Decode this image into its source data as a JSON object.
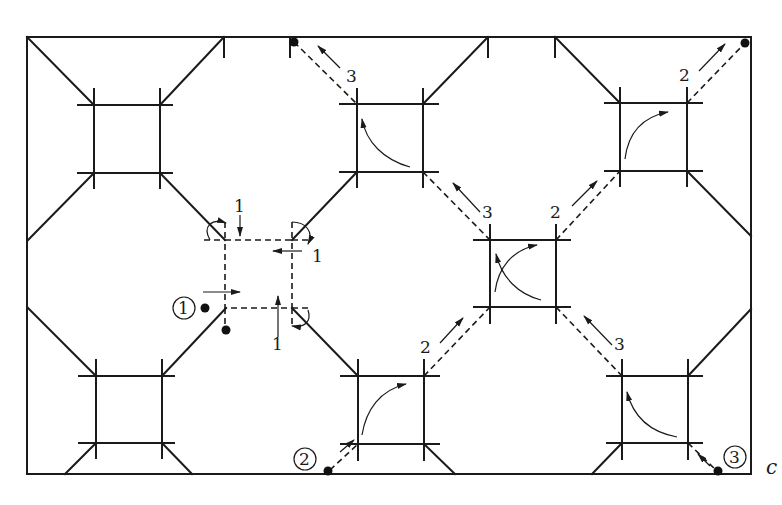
{
  "figure": {
    "type": "geometric-pattern-diagram",
    "corner_label": "c",
    "colors": {
      "line": "#1a1a1a",
      "background": "#ffffff"
    }
  },
  "start_markers": [
    {
      "id": "1",
      "label": "1"
    },
    {
      "id": "2",
      "label": "2"
    },
    {
      "id": "3",
      "label": "3"
    }
  ],
  "path_labels": {
    "path1": [
      "1",
      "1",
      "1"
    ],
    "path2": [
      "2",
      "2",
      "2",
      "2"
    ],
    "path3": [
      "3",
      "3",
      "3",
      "3"
    ]
  },
  "labels": {
    "p1_top": "1",
    "p1_right": "1",
    "p1_bottom": "1",
    "p3_topmid": "3",
    "p3_center_ul": "3",
    "p3_center_lr": "3",
    "p2_topright": "2",
    "p2_center_ur": "2",
    "p2_center_ll": "2",
    "circle1": "1",
    "circle2": "2",
    "circle3": "3",
    "corner_c": "c"
  }
}
